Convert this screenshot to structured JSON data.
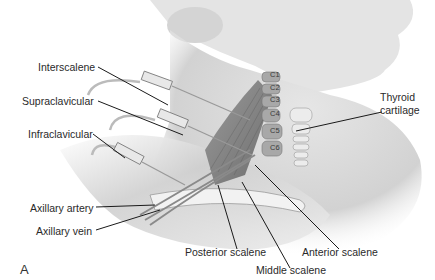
{
  "figure": {
    "panel_letter": "A",
    "labels": {
      "interscalene": "Interscalene",
      "supraclavicular": "Supraclavicular",
      "infraclavicular": "Infraclavicular",
      "axillary_artery": "Axillary artery",
      "axillary_vein": "Axillary vein",
      "posterior_scalene": "Posterior scalene",
      "middle_scalene": "Middle scalene",
      "anterior_scalene": "Anterior scalene",
      "thyroid_line1": "Thyroid",
      "thyroid_line2": "cartilage"
    },
    "vertebrae": [
      "C1",
      "C2",
      "C3",
      "C4",
      "C5",
      "C6"
    ],
    "colors": {
      "background": "#ffffff",
      "skin": "#d9d9d9",
      "muscle": "#8a8a8a",
      "leader_line": "#1a1a1a"
    }
  }
}
